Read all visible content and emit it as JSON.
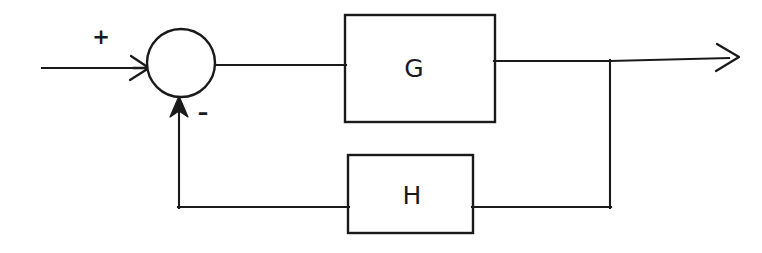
{
  "diagram": {
    "kind": "control-system-block-diagram",
    "background_color": "#ffffff",
    "line_color": "#1a1a1a",
    "canvas": {
      "width": 762,
      "height": 253
    },
    "blocks": [
      {
        "id": "forward-block",
        "label": "G",
        "role": "forward-path-transfer-function",
        "x": 345,
        "y": 15,
        "width": 150,
        "height": 107,
        "label_x": 414,
        "label_y": 69
      },
      {
        "id": "feedback-block",
        "label": "H",
        "role": "feedback-path-transfer-function",
        "x": 348,
        "y": 155,
        "width": 125,
        "height": 78,
        "label_x": 412,
        "label_y": 196
      }
    ],
    "summing_junction": {
      "id": "summing-junction",
      "center_x": 181,
      "center_y": 63,
      "radius": 34
    },
    "signs": [
      {
        "id": "plus-sign",
        "label": "+",
        "x": 101,
        "y": 37,
        "meaning": "positive-input"
      },
      {
        "id": "minus-sign",
        "label": "–",
        "x": 203,
        "y": 115,
        "meaning": "negative-feedback"
      }
    ],
    "connections": {
      "input_line": "M 42 68 L 146 68",
      "junction_to_g": "M 215 65 L 345 65",
      "g_to_takeoff": "M 495 61 L 610 61",
      "takeoff_to_output_arrow": "M 610 61 L 728 58",
      "takeoff_vertical": "M 610 61 L 610 207",
      "takeoff_to_h_right": "M 610 207 L 473 207",
      "h_left_to_corner": "M 348 207 L 179 207",
      "feedback_vertical": "M 179 207 L 179 100"
    },
    "arrows": [
      {
        "id": "input-arrowhead",
        "kind": "open-chevron",
        "tip_x": 148,
        "tip_y": 68,
        "direction": "right"
      },
      {
        "id": "output-arrowhead",
        "kind": "open-chevron",
        "tip_x": 737,
        "tip_y": 57,
        "direction": "right"
      },
      {
        "id": "feedback-arrowhead",
        "kind": "solid-triangle",
        "tip_x": 179,
        "tip_y": 97,
        "direction": "up"
      }
    ]
  }
}
